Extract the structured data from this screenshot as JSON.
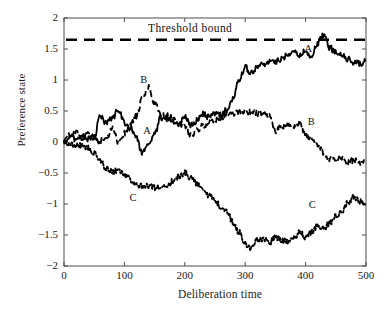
{
  "figure": {
    "title": "",
    "background_color": "#ffffff",
    "axis_color": "#4d4d4d",
    "curve_color": "#000000"
  },
  "axes": {
    "x": {
      "label": "Deliberation time",
      "min": 0,
      "max": 500,
      "ticks": [
        0,
        100,
        200,
        300,
        400,
        500
      ],
      "tick_labels": [
        "0",
        "100",
        "200",
        "300",
        "400",
        "500"
      ]
    },
    "y": {
      "label": "Preference state",
      "min": -2,
      "max": 2,
      "ticks": [
        -2,
        -1.5,
        -1,
        -0.5,
        0,
        0.5,
        1,
        1.5,
        2
      ],
      "tick_labels": [
        "−2",
        "−1.5",
        "−1",
        "−0.5",
        "0",
        "0.5",
        "1",
        "1.5",
        "2"
      ]
    }
  },
  "annotations": {
    "threshold_label": "Threshold  bound",
    "threshold_value": 1.65,
    "curve_tags": [
      {
        "text": "B",
        "x": 133,
        "y": 0.98
      },
      {
        "text": "A",
        "x": 138,
        "y": 0.16
      },
      {
        "text": "C",
        "x": 115,
        "y": -0.92
      },
      {
        "text": "A",
        "x": 405,
        "y": 1.49
      },
      {
        "text": "B",
        "x": 410,
        "y": 0.31
      },
      {
        "text": "C",
        "x": 412,
        "y": -1.03
      }
    ]
  },
  "chart_data": {
    "type": "line",
    "title": "",
    "xlabel": "Deliberation time",
    "ylabel": "Preference state",
    "xlim": [
      0,
      500
    ],
    "ylim": [
      -2,
      2
    ],
    "grid": false,
    "legend": "inline-labels",
    "threshold": {
      "name": "Threshold bound",
      "value": 1.65,
      "style": "dashed",
      "color": "#000000"
    },
    "series": [
      {
        "name": "A",
        "style": "solid",
        "color": "#000000",
        "x": [
          0,
          10,
          20,
          30,
          40,
          50,
          60,
          70,
          80,
          90,
          100,
          110,
          120,
          130,
          140,
          150,
          160,
          170,
          180,
          190,
          200,
          210,
          220,
          230,
          240,
          250,
          260,
          270,
          280,
          290,
          300,
          310,
          320,
          330,
          340,
          350,
          360,
          370,
          380,
          390,
          400,
          410,
          420,
          430,
          440,
          450,
          460,
          470,
          480,
          490,
          500
        ],
        "y": [
          0.0,
          0.06,
          0.04,
          0.1,
          0.05,
          0.08,
          0.42,
          0.3,
          0.38,
          0.52,
          0.3,
          0.22,
          0.05,
          -0.18,
          -0.05,
          0.12,
          0.4,
          0.38,
          0.33,
          0.3,
          0.42,
          0.28,
          0.34,
          0.45,
          0.4,
          0.46,
          0.44,
          0.52,
          0.72,
          1.02,
          1.2,
          1.12,
          1.22,
          1.25,
          1.3,
          1.28,
          1.34,
          1.42,
          1.48,
          1.4,
          1.46,
          1.38,
          1.6,
          1.72,
          1.52,
          1.44,
          1.4,
          1.34,
          1.28,
          1.26,
          1.32
        ]
      },
      {
        "name": "B",
        "style": "dashed",
        "color": "#000000",
        "x": [
          0,
          10,
          20,
          30,
          40,
          50,
          60,
          70,
          80,
          90,
          100,
          110,
          120,
          130,
          140,
          150,
          160,
          170,
          180,
          190,
          200,
          210,
          220,
          230,
          240,
          250,
          260,
          270,
          280,
          290,
          300,
          310,
          320,
          330,
          340,
          350,
          360,
          370,
          380,
          390,
          400,
          410,
          420,
          430,
          440,
          450,
          460,
          470,
          480,
          490,
          500
        ],
        "y": [
          0.0,
          0.12,
          0.16,
          0.06,
          0.12,
          0.04,
          0.02,
          0.06,
          0.22,
          0.0,
          0.14,
          0.28,
          0.42,
          0.7,
          0.88,
          0.62,
          0.44,
          0.42,
          0.38,
          0.3,
          0.26,
          0.12,
          0.18,
          0.26,
          0.32,
          0.36,
          0.4,
          0.44,
          0.46,
          0.48,
          0.5,
          0.48,
          0.46,
          0.44,
          0.42,
          0.18,
          0.24,
          0.3,
          0.22,
          0.32,
          0.12,
          0.06,
          -0.04,
          -0.18,
          -0.28,
          -0.3,
          -0.26,
          -0.32,
          -0.3,
          -0.34,
          -0.3
        ]
      },
      {
        "name": "C",
        "style": "dotted",
        "color": "#000000",
        "x": [
          0,
          10,
          20,
          30,
          40,
          50,
          60,
          70,
          80,
          90,
          100,
          110,
          120,
          130,
          140,
          150,
          160,
          170,
          180,
          190,
          200,
          210,
          220,
          230,
          240,
          250,
          260,
          270,
          280,
          290,
          300,
          310,
          320,
          330,
          340,
          350,
          360,
          370,
          380,
          390,
          400,
          410,
          420,
          430,
          440,
          450,
          460,
          470,
          480,
          490,
          500
        ],
        "y": [
          0.0,
          -0.02,
          -0.06,
          -0.06,
          -0.1,
          -0.18,
          -0.3,
          -0.42,
          -0.48,
          -0.46,
          -0.52,
          -0.6,
          -0.7,
          -0.72,
          -0.7,
          -0.74,
          -0.72,
          -0.7,
          -0.64,
          -0.56,
          -0.5,
          -0.58,
          -0.66,
          -0.74,
          -0.86,
          -0.94,
          -1.06,
          -1.12,
          -1.3,
          -1.46,
          -1.64,
          -1.72,
          -1.58,
          -1.56,
          -1.62,
          -1.54,
          -1.58,
          -1.62,
          -1.56,
          -1.44,
          -1.54,
          -1.46,
          -1.34,
          -1.4,
          -1.3,
          -1.2,
          -1.12,
          -0.98,
          -0.88,
          -0.96,
          -1.02
        ]
      }
    ]
  }
}
